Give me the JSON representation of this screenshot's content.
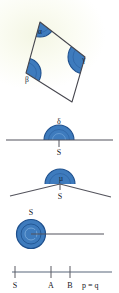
{
  "page": {
    "background_color": "#fbfcf3",
    "ink_color": "#3a3a42",
    "accent_color": "#2e6db4",
    "accent_dark_color": "#1f4f8a",
    "accent_light_color": "#4f8ed0"
  },
  "figures": [
    {
      "id": "quadrilateral",
      "name": "quadrilateral-with-interior-angles",
      "caption": "",
      "angles": [
        {
          "name": "angle-alpha",
          "label": "α",
          "vertex": "top"
        },
        {
          "name": "angle-beta",
          "label": "β",
          "vertex": "left"
        },
        {
          "name": "angle-gamma",
          "label": "γ",
          "vertex": "right"
        }
      ]
    },
    {
      "id": "straight-angle",
      "name": "straight-angle-figure",
      "angle_label": "δ",
      "vertex_label": "S",
      "description": "half disc on a straight line"
    },
    {
      "id": "reflex-angle",
      "name": "bent-line-angle-figure",
      "angle_label": "µ",
      "vertex_label": "S",
      "description": "half disc at bend of two rays"
    },
    {
      "id": "full-angle",
      "name": "full-turn-angle-figure",
      "vertex_label": "S",
      "description": "full circle with single ray"
    },
    {
      "id": "number-line",
      "name": "ray-with-points",
      "ticks": [
        {
          "name": "tick-s",
          "label": "S"
        },
        {
          "name": "tick-a",
          "label": "A"
        },
        {
          "name": "tick-b",
          "label": "B"
        }
      ],
      "equation": "p = q"
    }
  ]
}
